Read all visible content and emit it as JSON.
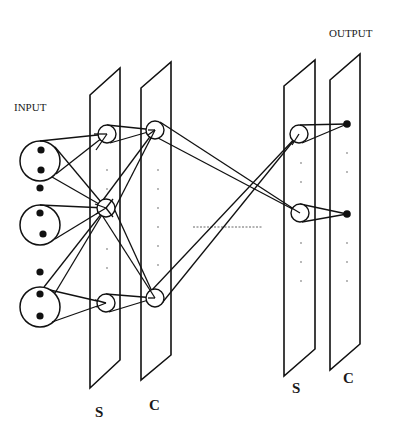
{
  "labels": {
    "input": "INPUT",
    "output": "OUTPUT",
    "layer1_s": "S",
    "layer1_c": "C",
    "layer2_s": "S",
    "layer2_c": "C"
  },
  "colors": {
    "stroke": "#111111",
    "background": "#ffffff"
  }
}
